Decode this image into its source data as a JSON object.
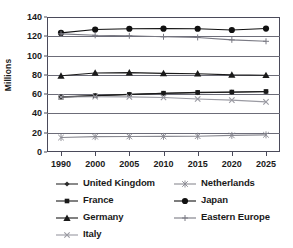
{
  "chart_data": {
    "type": "line",
    "title": "",
    "xlabel": "",
    "ylabel": "Millions",
    "x": [
      "1990",
      "2000",
      "2005",
      "2010",
      "2015",
      "2020",
      "2025"
    ],
    "categories": [
      "1990",
      "2000",
      "2005",
      "2010",
      "2015",
      "2020",
      "2025"
    ],
    "ylim": [
      0,
      140
    ],
    "yticks": [
      "0",
      "20",
      "40",
      "60",
      "80",
      "100",
      "120",
      "140"
    ],
    "ytick_values": [
      0,
      20,
      40,
      60,
      80,
      100,
      120,
      140
    ],
    "grid": true,
    "legend_position": "bottom",
    "series": [
      {
        "name": "United Kingdom",
        "marker": "diamond",
        "color": "#2b2b2b",
        "values": [
          57.2,
          58.5,
          59.8,
          60.8,
          61.5,
          62.0,
          62.5
        ]
      },
      {
        "name": "France",
        "marker": "square",
        "color": "#1a1a1a",
        "values": [
          56.9,
          58.4,
          59.7,
          61.0,
          61.8,
          62.2,
          62.8
        ]
      },
      {
        "name": "Germany",
        "marker": "triangle",
        "color": "#1a1a1a",
        "values": [
          79.0,
          82.0,
          82.3,
          81.5,
          81.2,
          80.0,
          79.6
        ]
      },
      {
        "name": "Italy",
        "marker": "x",
        "color": "#9a9aa2",
        "values": [
          57.0,
          57.3,
          57.2,
          56.5,
          55.0,
          53.8,
          52.0
        ]
      },
      {
        "name": "Netherlands",
        "marker": "star",
        "color": "#8a8a92",
        "values": [
          15.0,
          15.9,
          16.1,
          16.2,
          16.4,
          17.2,
          17.8
        ]
      },
      {
        "name": "Japan",
        "marker": "circle",
        "color": "#111111",
        "values": [
          123.5,
          127.0,
          127.8,
          127.9,
          127.8,
          126.5,
          128.0
        ]
      },
      {
        "name": "Eastern Europe",
        "marker": "plus",
        "color": "#7a7a84",
        "values": [
          122.5,
          121.0,
          120.5,
          119.5,
          118.8,
          116.3,
          114.8
        ]
      }
    ]
  },
  "axes": {
    "y_title": "Millions"
  },
  "legend": {
    "items": [
      {
        "label": "United Kingdom"
      },
      {
        "label": "Netherlands"
      },
      {
        "label": "France"
      },
      {
        "label": "Japan"
      },
      {
        "label": "Germany"
      },
      {
        "label": "Eastern Europe"
      },
      {
        "label": "Italy"
      }
    ]
  },
  "colors": {
    "axis": "#4a4a5a",
    "grid": "#6c6c78",
    "text": "#1a1a1a"
  }
}
